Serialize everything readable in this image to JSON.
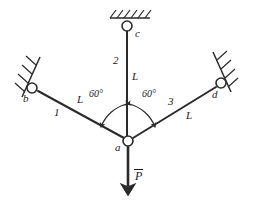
{
  "figure": {
    "type": "truss-free-body-diagram",
    "background_color": "#ffffff",
    "line_color": "#2a2a2a",
    "width": 257,
    "height": 201
  },
  "nodes": {
    "a": {
      "label": "a",
      "x": 128,
      "y": 141,
      "kind": "pin-joint"
    },
    "b": {
      "label": "b",
      "x": 32,
      "y": 88,
      "kind": "wall-support-left"
    },
    "c": {
      "label": "c",
      "x": 127,
      "y": 26,
      "kind": "ceiling-support"
    },
    "d": {
      "label": "d",
      "x": 221,
      "y": 83,
      "kind": "wall-support-right"
    }
  },
  "members": [
    {
      "id": "1",
      "label": "1",
      "length_label": "L",
      "from": "b",
      "to": "a"
    },
    {
      "id": "2",
      "label": "2",
      "length_label": "L",
      "from": "c",
      "to": "a"
    },
    {
      "id": "3",
      "label": "3",
      "length_label": "L",
      "from": "d",
      "to": "a"
    }
  ],
  "angles": [
    {
      "label": "60°",
      "value": 60,
      "unit": "degree",
      "between": [
        "1",
        "2"
      ]
    },
    {
      "label": "60°",
      "value": 60,
      "unit": "degree",
      "between": [
        "2",
        "3"
      ]
    }
  ],
  "load": {
    "symbol": "P",
    "overbar": true,
    "direction": "down",
    "applied_at": "a"
  }
}
